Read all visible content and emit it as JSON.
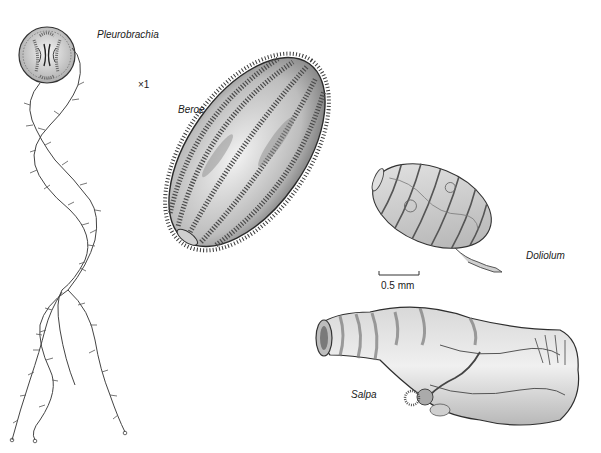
{
  "figure": {
    "specimens": [
      {
        "id": "pleurobrachia",
        "label": "Pleurobrachia",
        "group": "ctenophore"
      },
      {
        "id": "beroe",
        "label": "Beroe",
        "group": "ctenophore"
      },
      {
        "id": "doliolum",
        "label": "Doliolum",
        "group": "tunicate"
      },
      {
        "id": "salpa",
        "label": "Salpa",
        "group": "tunicate"
      }
    ],
    "magnification": "×1",
    "scale_bar": {
      "label": "0.5 mm"
    }
  },
  "colors": {
    "ink": "#2a2a2a",
    "shade": "#9a9a9a",
    "light_shade": "#d4d4d4",
    "background": "#ffffff"
  }
}
